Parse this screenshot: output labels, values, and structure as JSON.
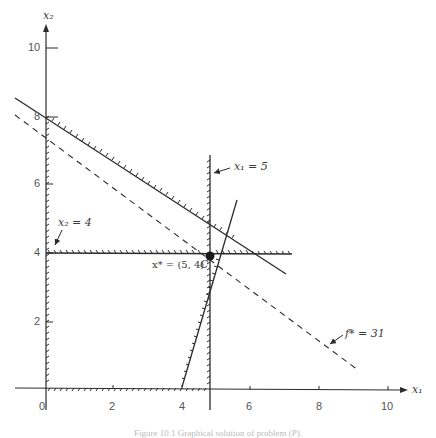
{
  "figure": {
    "axes": {
      "x_label": "x₁",
      "y_label": "x₂",
      "x_ticks": [
        "0",
        "2",
        "4",
        "6",
        "8",
        "10"
      ],
      "y_ticks": [
        "2",
        "4",
        "6",
        "8",
        "10"
      ]
    },
    "annotations": {
      "x1_constraint": "x₁ = 5",
      "x2_constraint": "x₂ = 4",
      "optimum": "x* = (5, 4)",
      "point_label": "C",
      "objective": "f* = 31"
    },
    "caption": "Figure 10.1  Graphical solution of problem (P)."
  },
  "colors": {
    "ink": "#2b2b2b",
    "label": "#3a3a3a",
    "background": "#ffffff"
  }
}
